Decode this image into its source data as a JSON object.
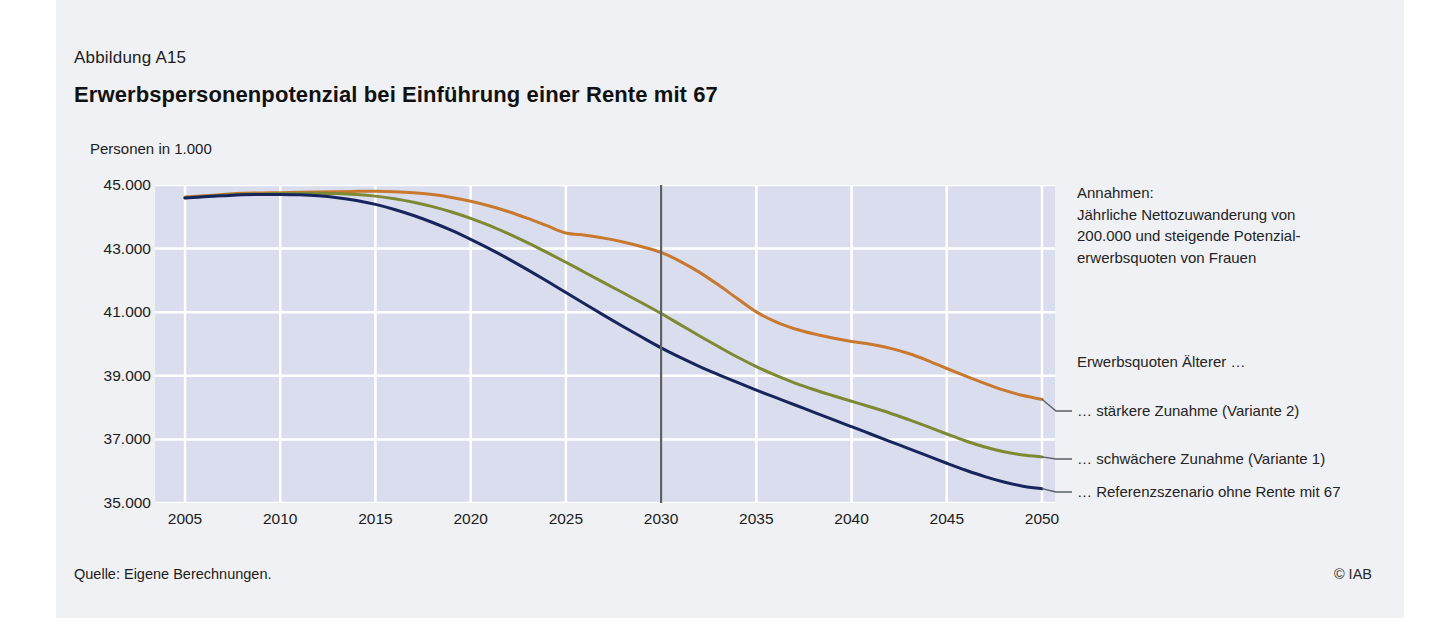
{
  "figure": {
    "number": "Abbildung A15",
    "title": "Erwerbspersonenpotenzial bei Einführung einer Rente mit 67",
    "source": "Quelle: Eigene Berechnungen.",
    "copyright": "© IAB",
    "panel_bg": "#f0f1f4",
    "plot_bg": "#d9dded",
    "grid_color": "#ffffff"
  },
  "annotations": {
    "assumptions_line1": "Annahmen:",
    "assumptions_line2": "Jährliche Nettozuwanderung von",
    "assumptions_line3": "200.000 und steigende Potenzial-",
    "assumptions_line4": "erwerbsquoten von Frauen",
    "legend_heading": "Erwerbsquoten Älterer …",
    "marker_year_label": "2030"
  },
  "chart_data": {
    "type": "line",
    "title": "Erwerbspersonenpotenzial bei Einführung einer Rente mit 67",
    "subtitle": "Abbildung A15",
    "xlabel": "",
    "ylabel": "Personen in 1.000",
    "xlim": [
      2005,
      2050
    ],
    "ylim": [
      35000,
      45000
    ],
    "yticks": [
      "45.000",
      "43.000",
      "41.000",
      "39.000",
      "37.000",
      "35.000"
    ],
    "ytick_values": [
      45000,
      43000,
      41000,
      39000,
      37000,
      35000
    ],
    "xticks": [
      "2005",
      "2010",
      "2015",
      "2020",
      "2025",
      "2030",
      "2035",
      "2040",
      "2045",
      "2050"
    ],
    "xtick_values": [
      2005,
      2010,
      2015,
      2020,
      2025,
      2030,
      2035,
      2040,
      2045,
      2050
    ],
    "grid": true,
    "legend_position": "right",
    "vertical_marker": {
      "x": 2030,
      "color": "#5a6066"
    },
    "x": [
      2005,
      2006,
      2007,
      2008,
      2009,
      2010,
      2011,
      2012,
      2013,
      2014,
      2015,
      2016,
      2017,
      2018,
      2019,
      2020,
      2021,
      2022,
      2023,
      2024,
      2025,
      2026,
      2027,
      2028,
      2029,
      2030,
      2031,
      2032,
      2033,
      2034,
      2035,
      2036,
      2037,
      2038,
      2039,
      2040,
      2041,
      2042,
      2043,
      2044,
      2045,
      2046,
      2047,
      2048,
      2049,
      2050
    ],
    "series": [
      {
        "name": "… stärkere Zunahme (Variante 2)",
        "label": "… stärkere Zunahme (Variante 2)",
        "color": "#c8792f",
        "values": [
          44620,
          44660,
          44700,
          44740,
          44750,
          44760,
          44770,
          44780,
          44790,
          44800,
          44800,
          44790,
          44760,
          44700,
          44610,
          44490,
          44340,
          44160,
          43950,
          43720,
          43490,
          43420,
          43330,
          43210,
          43060,
          42880,
          42600,
          42260,
          41860,
          41430,
          41010,
          40700,
          40480,
          40320,
          40190,
          40080,
          39990,
          39870,
          39700,
          39480,
          39230,
          38990,
          38760,
          38550,
          38380,
          38260
        ]
      },
      {
        "name": "… schwächere Zunahme (Variante 1)",
        "label": "… schwächere Zunahme (Variante 1)",
        "color": "#7d8a33",
        "values": [
          44600,
          44640,
          44680,
          44710,
          44720,
          44730,
          44740,
          44740,
          44730,
          44700,
          44650,
          44570,
          44460,
          44320,
          44150,
          43950,
          43720,
          43460,
          43180,
          42880,
          42570,
          42250,
          41930,
          41610,
          41290,
          40960,
          40610,
          40260,
          39920,
          39590,
          39290,
          39020,
          38780,
          38570,
          38380,
          38200,
          38020,
          37830,
          37620,
          37400,
          37170,
          36950,
          36760,
          36610,
          36510,
          36450
        ]
      },
      {
        "name": "… Referenzszenario ohne Rente mit 67",
        "label": "… Referenzszenario ohne Rente mit 67",
        "color": "#17255c",
        "values": [
          44590,
          44630,
          44660,
          44690,
          44700,
          44700,
          44690,
          44660,
          44600,
          44510,
          44390,
          44230,
          44040,
          43820,
          43570,
          43290,
          42990,
          42670,
          42330,
          41980,
          41620,
          41260,
          40900,
          40550,
          40210,
          39880,
          39580,
          39300,
          39040,
          38790,
          38550,
          38320,
          38090,
          37860,
          37630,
          37400,
          37170,
          36940,
          36710,
          36480,
          36250,
          36030,
          35830,
          35660,
          35530,
          35450
        ]
      }
    ]
  }
}
